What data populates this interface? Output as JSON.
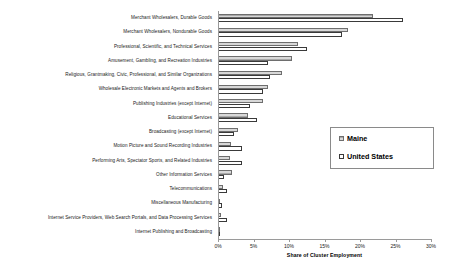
{
  "chart_data": {
    "type": "bar",
    "orientation": "horizontal",
    "title": "",
    "xlabel": "Share of Cluster Employment",
    "ylabel": "",
    "xlim": [
      0,
      30
    ],
    "xticks": [
      0,
      5,
      10,
      15,
      20,
      25,
      30
    ],
    "xtick_labels": [
      "0%",
      "5%",
      "10%",
      "15%",
      "20%",
      "25%",
      "30%"
    ],
    "grid": false,
    "legend_position": "center-right",
    "categories": [
      "Merchant Wholesalers, Durable Goods",
      "Merchant Wholesalers, Nondurable Goods",
      "Professional, Scientific, and Technical Services",
      "Amusement, Gambling, and Recreation Industries",
      "Religious, Grantmaking, Civic, Professional, and Similar Organizations",
      "Wholesale Electronic Markets and Agents and Brokers",
      "Publishing Industries (except Internet)",
      "Educational Services",
      "Broadcasting (except Internet)",
      "Motion Picture and Sound Recording Industries",
      "Performing Arts, Spectator Sports, and Related Industries",
      "Other Information Services",
      "Telecommunications",
      "Miscellaneous Manufacturing",
      "Internet Service Providers, Web Search Portals, and Data Processing Services",
      "Internet Publishing and Broadcasting"
    ],
    "series": [
      {
        "name": "Maine",
        "color": "#a9a9a9",
        "values": [
          21.8,
          18.3,
          11.3,
          10.4,
          9.0,
          7.0,
          6.3,
          4.2,
          2.8,
          1.8,
          1.7,
          2.0,
          0.7,
          0.3,
          0.4,
          0.2
        ]
      },
      {
        "name": "United States",
        "color": "#ffffff",
        "values": [
          26.1,
          17.4,
          12.6,
          7.0,
          7.3,
          6.4,
          4.5,
          5.5,
          2.2,
          3.4,
          3.4,
          0.8,
          1.3,
          0.5,
          1.2,
          0.2
        ]
      }
    ]
  },
  "legend": {
    "entries": [
      {
        "label": "Maine"
      },
      {
        "label": "United States"
      }
    ]
  },
  "axis": {
    "x_title": "Share of Cluster Employment"
  }
}
